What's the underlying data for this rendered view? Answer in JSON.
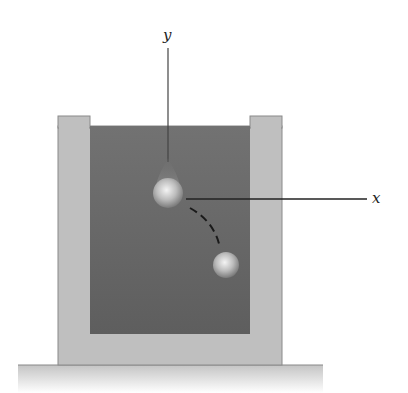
{
  "diagram": {
    "type": "physics-free-body-setup",
    "axes": {
      "x_label": "x",
      "y_label": "y"
    },
    "colors": {
      "container_wall": "#bdbdbd",
      "fluid": "#6a6a6a",
      "ground": "#cfcfcf",
      "axis_line": "#222222",
      "ball_highlight": "#f2f2f2",
      "ball_shadow": "#8a8a8a"
    },
    "objects": [
      {
        "name": "initial-ball",
        "label": ""
      },
      {
        "name": "final-ball",
        "label": ""
      },
      {
        "name": "trajectory",
        "style": "dashed"
      }
    ]
  }
}
